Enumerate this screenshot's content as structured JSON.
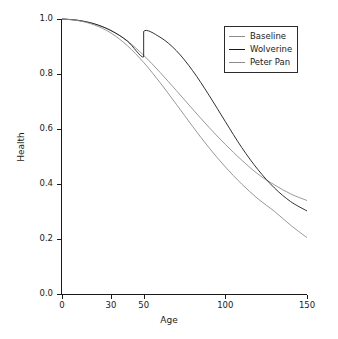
{
  "chart_data": {
    "type": "line",
    "title": "",
    "xlabel": "Age",
    "ylabel": "Health",
    "xlim": [
      0,
      150
    ],
    "ylim": [
      0.0,
      1.0
    ],
    "xticks": [
      0,
      30,
      50,
      100,
      150
    ],
    "xtick_labels": [
      "0",
      "30",
      "50",
      "100",
      "150"
    ],
    "yticks": [
      0.0,
      0.2,
      0.4,
      0.6,
      0.8,
      1.0
    ],
    "ytick_labels": [
      "0.0",
      "0.2",
      "0.4",
      "0.6",
      "0.8",
      "1.0"
    ],
    "grid": false,
    "legend_position": "upper right",
    "series": [
      {
        "name": "Baseline",
        "color": "#8c8c8c",
        "x": [
          0,
          10,
          20,
          30,
          40,
          50,
          60,
          70,
          80,
          90,
          100,
          110,
          120,
          130,
          140,
          150
        ],
        "values": [
          1.0,
          0.995,
          0.982,
          0.958,
          0.92,
          0.868,
          0.806,
          0.74,
          0.672,
          0.606,
          0.544,
          0.487,
          0.436,
          0.397,
          0.364,
          0.34
        ]
      },
      {
        "name": "Wolverine",
        "color": "#1a1a1a",
        "x": [
          0,
          10,
          20,
          30,
          40,
          50,
          50,
          60,
          70,
          80,
          90,
          100,
          110,
          120,
          130,
          140,
          150
        ],
        "values": [
          1.0,
          0.995,
          0.982,
          0.958,
          0.92,
          0.862,
          0.955,
          0.934,
          0.885,
          0.812,
          0.723,
          0.627,
          0.533,
          0.452,
          0.386,
          0.336,
          0.302
        ],
        "annotation": "discontinuous jump at Age 50 from 0.862 to 0.955"
      },
      {
        "name": "Peter Pan",
        "color": "#8c8c8c",
        "x": [
          0,
          10,
          20,
          30,
          40,
          50,
          60,
          70,
          80,
          90,
          100,
          110,
          120,
          130,
          140,
          150
        ],
        "values": [
          1.0,
          0.994,
          0.978,
          0.949,
          0.903,
          0.842,
          0.769,
          0.69,
          0.609,
          0.532,
          0.462,
          0.4,
          0.346,
          0.301,
          0.25,
          0.205
        ]
      }
    ]
  },
  "legend": {
    "entries": [
      {
        "label": "Baseline"
      },
      {
        "label": "Wolverine"
      },
      {
        "label": "Peter Pan"
      }
    ]
  }
}
